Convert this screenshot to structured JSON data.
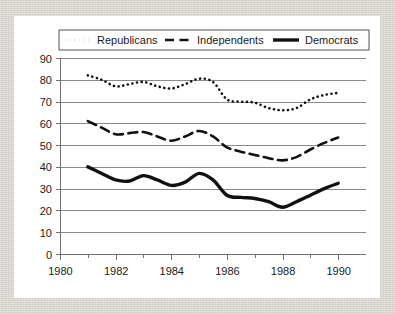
{
  "figure": {
    "card_background": "#ffffff",
    "page_background": "#d9d6d0",
    "line_color": "#111111",
    "grid_color": "#8a8a8a"
  },
  "legend": {
    "position": "top-center",
    "entries": [
      {
        "label": "Republicans",
        "style": "dotted",
        "swatch": "dotted-line-swatch"
      },
      {
        "label": "Independents",
        "style": "dashed",
        "swatch": "dashed-line-swatch"
      },
      {
        "label": "Democrats",
        "style": "solid",
        "swatch": "solid-line-swatch"
      }
    ]
  },
  "axes": {
    "y_ticks": [
      "90",
      "80",
      "70",
      "60",
      "50",
      "40",
      "30",
      "20",
      "10",
      "0"
    ],
    "x_ticks": [
      "1980",
      "1982",
      "1984",
      "1986",
      "1988",
      "1990"
    ],
    "x_minor_ticks": [
      "1981",
      "1983",
      "1985",
      "1987",
      "1989"
    ]
  },
  "chart_data": {
    "type": "line",
    "title": "",
    "subtitle": "",
    "xlabel": "",
    "ylabel": "",
    "xlim": [
      1980,
      1991
    ],
    "ylim": [
      0,
      90
    ],
    "grid": true,
    "grid_axis": "y",
    "legend_position": "top-center",
    "x": [
      1981,
      1981.5,
      1982,
      1982.5,
      1983,
      1983.5,
      1984,
      1984.5,
      1985,
      1985.5,
      1986,
      1986.5,
      1987,
      1987.5,
      1988,
      1988.5,
      1989,
      1989.5,
      1990
    ],
    "series": [
      {
        "name": "Republicans",
        "style": "dotted",
        "color": "#111111",
        "values": [
          82,
          80,
          77,
          78,
          79,
          77,
          76,
          78,
          80.5,
          79,
          71,
          70,
          69.5,
          67,
          66,
          67,
          71,
          73,
          74
        ]
      },
      {
        "name": "Independents",
        "style": "dashed",
        "color": "#111111",
        "values": [
          61,
          58,
          55,
          55.5,
          56,
          54,
          52,
          54,
          56.5,
          54,
          49,
          47,
          45.5,
          44,
          43,
          44.5,
          48,
          51,
          53.5
        ]
      },
      {
        "name": "Democrats",
        "style": "solid",
        "color": "#111111",
        "values": [
          40,
          37,
          34,
          33.5,
          36,
          34,
          31.5,
          33,
          37,
          34,
          27,
          26,
          25.5,
          24,
          21.5,
          24,
          27,
          30,
          32.5
        ]
      }
    ]
  }
}
